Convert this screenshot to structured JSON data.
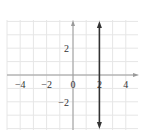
{
  "chart_data": {
    "type": "line",
    "title": "",
    "xlabel": "",
    "ylabel": "",
    "xlim": [
      -5,
      5
    ],
    "ylim": [
      -4,
      4
    ],
    "grid": true,
    "x_ticks": [
      -4,
      -2,
      0,
      2,
      4
    ],
    "x_tick_labels": [
      "−4",
      "−2",
      "0",
      "2",
      "4"
    ],
    "y_ticks": [
      2,
      -2
    ],
    "y_tick_labels": [
      "2",
      "−2"
    ],
    "series": [
      {
        "name": "x = 2",
        "description": "vertical line with arrows at both ends",
        "x": [
          2,
          2
        ],
        "y": [
          -4,
          4
        ],
        "color": "#333333"
      }
    ]
  },
  "colors": {
    "grid": "#e6e6e6",
    "axis": "#9a9a9a",
    "line": "#333333"
  }
}
